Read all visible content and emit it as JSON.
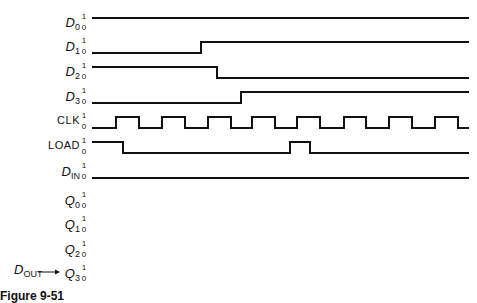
{
  "figure": {
    "caption": "Figure 9-51",
    "levels": {
      "high": "1",
      "low": "0"
    }
  },
  "signals": [
    {
      "id": "D0",
      "label_main": "D",
      "label_sub": "0",
      "style": "italic",
      "row_y": 18
    },
    {
      "id": "D1",
      "label_main": "D",
      "label_sub": "1",
      "style": "italic",
      "row_y": 42
    },
    {
      "id": "D2",
      "label_main": "D",
      "label_sub": "2",
      "style": "italic",
      "row_y": 67
    },
    {
      "id": "D3",
      "label_main": "D",
      "label_sub": "3",
      "style": "italic",
      "row_y": 92
    },
    {
      "id": "CLK",
      "label_main": "CLK",
      "label_sub": "",
      "style": "plain",
      "row_y": 117
    },
    {
      "id": "LOAD",
      "label_main": "LOAD",
      "label_sub": "",
      "style": "plain",
      "row_y": 142
    },
    {
      "id": "DIN",
      "label_main": "D",
      "label_sub": "IN",
      "style": "italic",
      "row_y": 167
    },
    {
      "id": "Q0",
      "label_main": "Q",
      "label_sub": "0",
      "style": "italic",
      "row_y": 196
    },
    {
      "id": "Q1",
      "label_main": "Q",
      "label_sub": "1",
      "style": "italic",
      "row_y": 220
    },
    {
      "id": "Q2",
      "label_main": "Q",
      "label_sub": "2",
      "style": "italic",
      "row_y": 245
    },
    {
      "id": "Q3",
      "label_main": "Q",
      "label_sub": "3",
      "style": "italic",
      "row_y": 269
    }
  ],
  "output_tag": {
    "label_main": "D",
    "label_sub": "OUT",
    "arrow_to": "Q3"
  },
  "waveforms": {
    "x_start": 92,
    "x_end": 469,
    "D0": {
      "initial": 1,
      "transitions": []
    },
    "D1": {
      "initial": 0,
      "transitions": [
        201
      ]
    },
    "D2": {
      "initial": 1,
      "transitions": [
        217
      ]
    },
    "D3": {
      "initial": 0,
      "transitions": [
        241
      ]
    },
    "CLK": {
      "initial": 0,
      "transitions": [
        116,
        139,
        162,
        185,
        208,
        231,
        252,
        275,
        297,
        320,
        344,
        366,
        389,
        412,
        435,
        458
      ]
    },
    "LOAD": {
      "initial": 1,
      "transitions": [
        123,
        290,
        310
      ]
    },
    "DIN": {
      "initial": 0,
      "transitions": []
    },
    "Q0": {
      "initial": null,
      "transitions": []
    },
    "Q1": {
      "initial": null,
      "transitions": []
    },
    "Q2": {
      "initial": null,
      "transitions": []
    },
    "Q3": {
      "initial": null,
      "transitions": []
    }
  }
}
